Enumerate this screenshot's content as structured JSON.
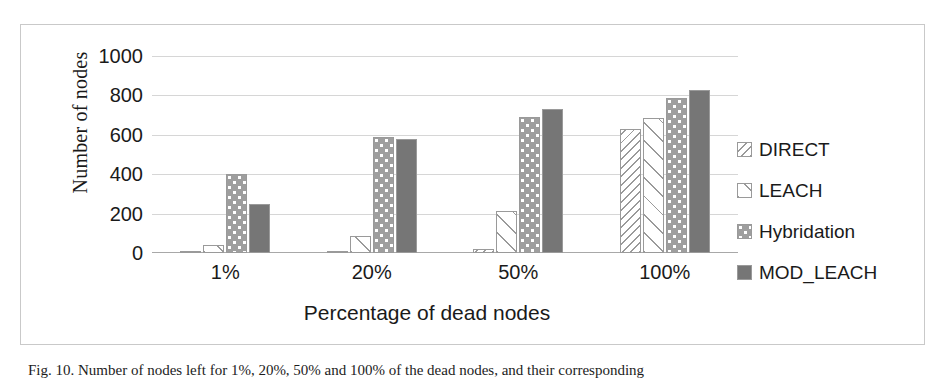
{
  "chart_data": {
    "type": "bar",
    "title": "",
    "xlabel": "Percentage of dead nodes",
    "ylabel": "Number of nodes",
    "categories": [
      "1%",
      "20%",
      "50%",
      "100%"
    ],
    "ylim": [
      0,
      1000
    ],
    "yticks": [
      0,
      200,
      400,
      600,
      800,
      1000
    ],
    "ytick_labels": [
      "0",
      "200",
      "400",
      "600",
      "800",
      "1000"
    ],
    "grid": true,
    "legend_position": "right",
    "series": [
      {
        "name": "DIRECT",
        "pattern": "diagonal-hatch-backward",
        "color": "#ffffff",
        "values": [
          5,
          8,
          20,
          630
        ]
      },
      {
        "name": "LEACH",
        "pattern": "diagonal-hatch-forward-sparse",
        "color": "#ffffff",
        "values": [
          40,
          85,
          215,
          685
        ]
      },
      {
        "name": "Hybridation",
        "pattern": "gray-with-white-dots",
        "color": "#9e9e9e",
        "values": [
          400,
          590,
          690,
          785
        ]
      },
      {
        "name": "MOD_LEACH",
        "pattern": "solid",
        "color": "#767676",
        "values": [
          250,
          580,
          730,
          825
        ]
      }
    ]
  },
  "caption": {
    "text": "Fig. 10. Number of nodes left for 1%, 20%, 50% and 100% of the dead nodes, and their corresponding"
  }
}
